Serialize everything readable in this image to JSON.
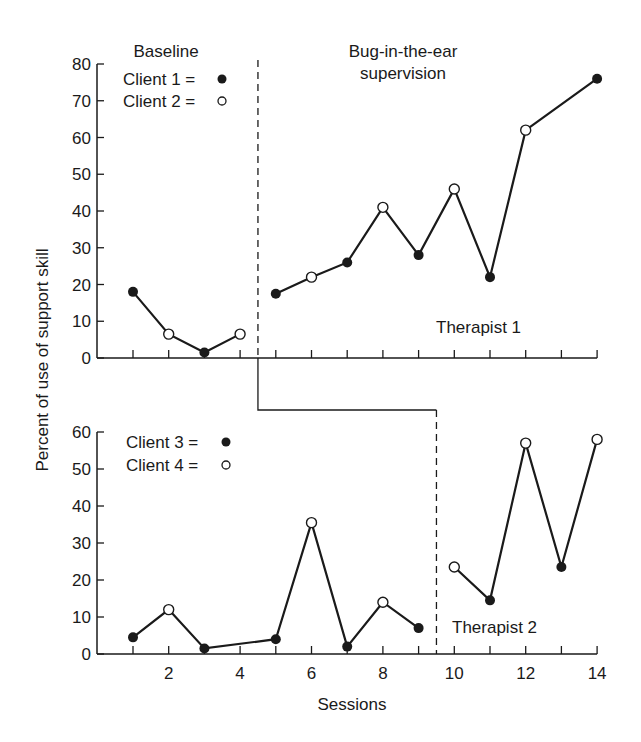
{
  "chart_data": {
    "type": "line",
    "title": "",
    "ylabel": "Percent of use of support skill",
    "xlabel": "Sessions",
    "x_ticks": [
      2,
      4,
      6,
      8,
      10,
      12,
      14
    ],
    "phase_labels": {
      "baseline": "Baseline",
      "treatment_line1": "Bug-in-the-ear",
      "treatment_line2": "supervision"
    },
    "panels": [
      {
        "name": "Therapist 1",
        "ylim": [
          0,
          80
        ],
        "yticks": [
          0,
          10,
          20,
          30,
          40,
          50,
          60,
          70,
          80
        ],
        "phase_change_after_session": 4.5,
        "legend": [
          {
            "label": "Client 1 =",
            "marker": "filled"
          },
          {
            "label": "Client 2 =",
            "marker": "open"
          }
        ],
        "segments": [
          {
            "phase": "baseline",
            "points": [
              {
                "x": 1,
                "y": 18,
                "client": 1
              },
              {
                "x": 2,
                "y": 6.5,
                "client": 2
              },
              {
                "x": 3,
                "y": 1.5,
                "client": 1
              },
              {
                "x": 4,
                "y": 6.5,
                "client": 2
              }
            ]
          },
          {
            "phase": "treatment",
            "points": [
              {
                "x": 5,
                "y": 17.5,
                "client": 1
              },
              {
                "x": 6,
                "y": 22,
                "client": 2
              },
              {
                "x": 7,
                "y": 26,
                "client": 1
              },
              {
                "x": 8,
                "y": 41,
                "client": 2
              },
              {
                "x": 9,
                "y": 28,
                "client": 1
              },
              {
                "x": 10,
                "y": 46,
                "client": 2
              },
              {
                "x": 11,
                "y": 22,
                "client": 1
              },
              {
                "x": 12,
                "y": 62,
                "client": 2
              },
              {
                "x": 14,
                "y": 76,
                "client": 1
              }
            ]
          }
        ]
      },
      {
        "name": "Therapist 2",
        "ylim": [
          0,
          60
        ],
        "yticks": [
          0,
          10,
          20,
          30,
          40,
          50,
          60
        ],
        "phase_change_after_session": 9.5,
        "legend": [
          {
            "label": "Client 3 =",
            "marker": "filled"
          },
          {
            "label": "Client 4 =",
            "marker": "open"
          }
        ],
        "segments": [
          {
            "phase": "baseline",
            "points": [
              {
                "x": 1,
                "y": 4.5,
                "client": 3
              },
              {
                "x": 2,
                "y": 12,
                "client": 4
              },
              {
                "x": 3,
                "y": 1.5,
                "client": 3
              },
              {
                "x": 5,
                "y": 4,
                "client": 3
              },
              {
                "x": 6,
                "y": 35.5,
                "client": 4
              },
              {
                "x": 7,
                "y": 2,
                "client": 3
              },
              {
                "x": 8,
                "y": 14,
                "client": 4
              },
              {
                "x": 9,
                "y": 7,
                "client": 3
              }
            ]
          },
          {
            "phase": "treatment",
            "points": [
              {
                "x": 10,
                "y": 23.5,
                "client": 4
              },
              {
                "x": 11,
                "y": 14.5,
                "client": 3
              },
              {
                "x": 12,
                "y": 57,
                "client": 4
              },
              {
                "x": 13,
                "y": 23.5,
                "client": 3
              },
              {
                "x": 14,
                "y": 58,
                "client": 4
              }
            ]
          }
        ]
      }
    ]
  }
}
